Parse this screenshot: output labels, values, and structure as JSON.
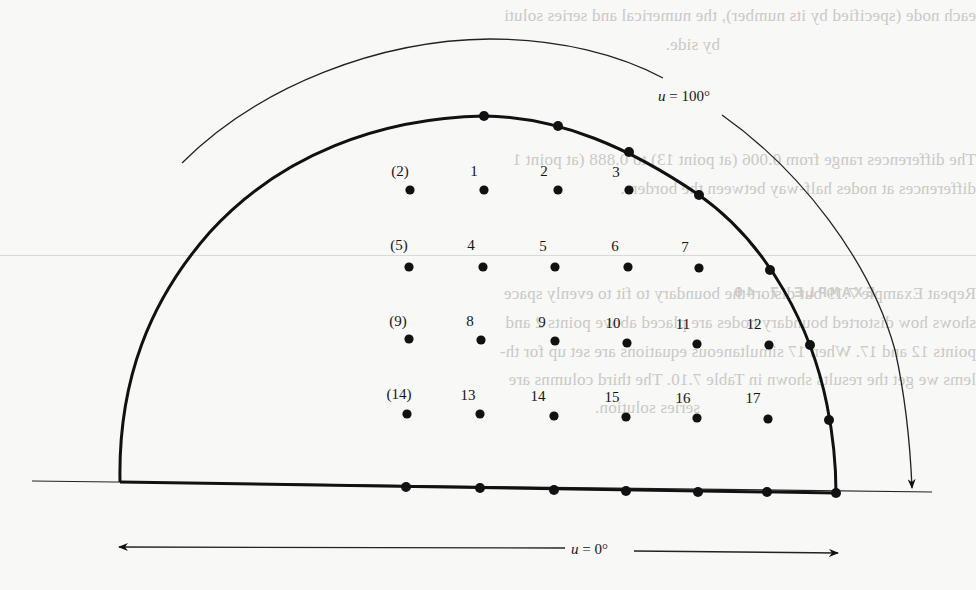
{
  "figure": {
    "type": "finite-difference grid on semicircular region",
    "labels": {
      "top_var": "u",
      "top_eq": " = 100°",
      "bottom_var": "u",
      "bottom_eq": " = 0°"
    },
    "colors": {
      "ink": "#111111",
      "paper": "#f8f8f6",
      "ghost_text": "#c9c9c6"
    },
    "interior_nodes": [
      {
        "label": "(2)",
        "x": 410,
        "y": 190,
        "lx": 388,
        "ly": 164
      },
      {
        "label": "1",
        "x": 484,
        "y": 190,
        "lx": 470,
        "ly": 164
      },
      {
        "label": "2",
        "x": 558,
        "y": 190,
        "lx": 540,
        "ly": 164
      },
      {
        "label": "3",
        "x": 629,
        "y": 190,
        "lx": 612,
        "ly": 165
      },
      {
        "label": "(5)",
        "x": 409,
        "y": 267,
        "lx": 387,
        "ly": 238
      },
      {
        "label": "4",
        "x": 483,
        "y": 267,
        "lx": 467,
        "ly": 238
      },
      {
        "label": "5",
        "x": 555,
        "y": 267,
        "lx": 539,
        "ly": 239
      },
      {
        "label": "6",
        "x": 628,
        "y": 267,
        "lx": 611,
        "ly": 239
      },
      {
        "label": "7",
        "x": 699,
        "y": 268,
        "lx": 681,
        "ly": 240
      },
      {
        "label": "(9)",
        "x": 409,
        "y": 339,
        "lx": 386,
        "ly": 314
      },
      {
        "label": "8",
        "x": 481,
        "y": 340,
        "lx": 466,
        "ly": 314
      },
      {
        "label": "9",
        "x": 555,
        "y": 341,
        "lx": 538,
        "ly": 315
      },
      {
        "label": "10",
        "x": 627,
        "y": 343,
        "lx": 605,
        "ly": 316
      },
      {
        "label": "11",
        "x": 697,
        "y": 344,
        "lx": 675,
        "ly": 317
      },
      {
        "label": "12",
        "x": 769,
        "y": 345,
        "lx": 746,
        "ly": 317
      },
      {
        "label": "(14)",
        "x": 407,
        "y": 414,
        "lx": 383,
        "ly": 387
      },
      {
        "label": "13",
        "x": 480,
        "y": 414,
        "lx": 460,
        "ly": 388
      },
      {
        "label": "14",
        "x": 554,
        "y": 416,
        "lx": 530,
        "ly": 389
      },
      {
        "label": "15",
        "x": 626,
        "y": 417,
        "lx": 604,
        "ly": 390
      },
      {
        "label": "16",
        "x": 697,
        "y": 418,
        "lx": 675,
        "ly": 391
      },
      {
        "label": "17",
        "x": 768,
        "y": 419,
        "lx": 745,
        "ly": 391
      }
    ],
    "boundary_nodes": [
      {
        "x": 484,
        "y": 116
      },
      {
        "x": 558,
        "y": 126
      },
      {
        "x": 629,
        "y": 152
      },
      {
        "x": 699,
        "y": 195
      },
      {
        "x": 770,
        "y": 270
      },
      {
        "x": 810,
        "y": 345
      },
      {
        "x": 829,
        "y": 420
      },
      {
        "x": 406,
        "y": 487
      },
      {
        "x": 480,
        "y": 488
      },
      {
        "x": 554,
        "y": 490
      },
      {
        "x": 626,
        "y": 491
      },
      {
        "x": 698,
        "y": 492
      },
      {
        "x": 767,
        "y": 492
      },
      {
        "x": 836,
        "y": 493
      }
    ]
  },
  "ghost_text": {
    "lines": [
      "each node (specified by its number), the numerical and series soluti",
      "by side.",
      "The differences range from 0.006 (at point 13) to 0.888 (at point 1",
      "differences at nodes half-way between the borders.",
      "Repeat Example 7.19 but distort the boundary to fit to evenly space",
      "shows how distorted boundary nodes are placed above points 2 and",
      "points 12 and 17. When 17 simultaneous equations are set up for th-",
      "lems we get the results shown in Table 7.10. The third columns are",
      "series solution."
    ],
    "heading": "EXAMPLE 7.40"
  }
}
